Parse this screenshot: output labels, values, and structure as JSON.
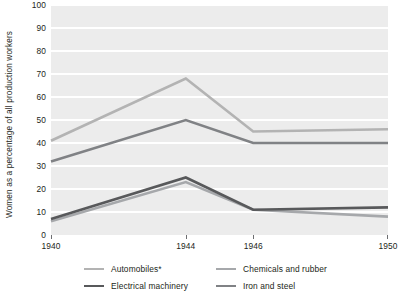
{
  "chart_data": {
    "type": "line",
    "title": "",
    "subtitle": "",
    "xlabel": "",
    "ylabel": "Women as a percentage of all production workers",
    "x": [
      1940,
      1944,
      1946,
      1950
    ],
    "xtick_labels": [
      "1940",
      "1944",
      "1946",
      "1950"
    ],
    "categories": [
      "1940",
      "1944",
      "1946",
      "1950"
    ],
    "ylim": [
      0,
      100
    ],
    "ytick_labels": [
      "0",
      "10",
      "20",
      "30",
      "40",
      "50",
      "60",
      "70",
      "80",
      "90",
      "100"
    ],
    "ytick_values": [
      0,
      10,
      20,
      30,
      40,
      50,
      60,
      70,
      80,
      90,
      100
    ],
    "grid": "horizontal-white-on-gray",
    "legend_position": "bottom",
    "plot_background": "#ececec",
    "gridline_color": "#ffffff",
    "series": [
      {
        "name": "Automobiles*",
        "color": "#b3b3b3",
        "values": [
          41,
          68,
          45,
          46
        ]
      },
      {
        "name": "Chemicals and rubber",
        "color": "#a6a8ab",
        "values": [
          6,
          23,
          11,
          8
        ]
      },
      {
        "name": "Electrical machinery",
        "color": "#58595b",
        "values": [
          7,
          25,
          11,
          12
        ]
      },
      {
        "name": "Iron and steel",
        "color": "#808285",
        "values": [
          32,
          50,
          40,
          40
        ]
      }
    ],
    "legend_order": [
      "Automobiles*",
      "Chemicals and rubber",
      "Electrical machinery",
      "Iron and steel"
    ]
  }
}
